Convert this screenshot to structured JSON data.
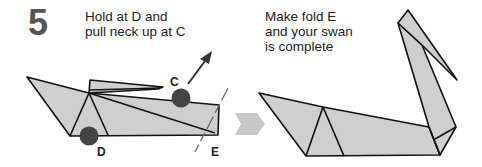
{
  "step": {
    "number": "5",
    "left_instruction": [
      "Hold at D and",
      "pull neck up at C"
    ],
    "right_instruction": [
      "Make fold E",
      "and your swan",
      "is complete"
    ]
  },
  "labels": {
    "c": "C",
    "d": "D",
    "e": "E"
  },
  "colors": {
    "paper_fill": "#cfcfcf",
    "outline": "#111111",
    "marker_dot": "#444444",
    "arrow": "#333333",
    "next_step_arrow": "#c8c8c8",
    "step_number": "#555555"
  }
}
